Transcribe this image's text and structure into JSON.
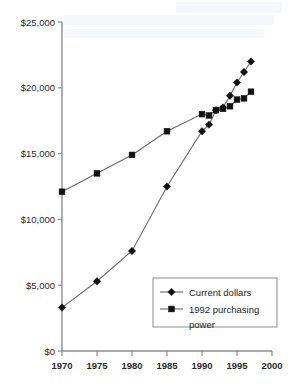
{
  "chart_data": {
    "type": "line",
    "title": "",
    "subtitle": "",
    "xlabel": "",
    "ylabel": "",
    "x": [
      1970,
      1975,
      1980,
      1985,
      1990,
      1991,
      1992,
      1993,
      1994,
      1995,
      1996,
      1997
    ],
    "xlim": [
      1970,
      2000
    ],
    "ylim": [
      0,
      25000
    ],
    "grid": false,
    "legend_position": "bottom-right",
    "xticks": [
      1970,
      1975,
      1980,
      1985,
      1990,
      1995,
      2000
    ],
    "xtick_labels": [
      "1970",
      "1975",
      "1980",
      "1985",
      "1990",
      "1995",
      "2000"
    ],
    "yticks": [
      0,
      5000,
      10000,
      15000,
      20000,
      25000
    ],
    "ytick_labels": [
      "$0",
      "$5,000",
      "$10,000",
      "$15,000",
      "$20,000",
      "$25,000"
    ],
    "series": [
      {
        "name": "Current dollars",
        "marker": "diamond",
        "color": "#111111",
        "values": [
          3300,
          5300,
          7600,
          12500,
          16700,
          17200,
          18300,
          18500,
          19400,
          20400,
          21200,
          22000
        ]
      },
      {
        "name": "1992 purchasing power",
        "marker": "square",
        "color": "#111111",
        "values": [
          12100,
          13500,
          14900,
          16700,
          18000,
          17900,
          18300,
          18400,
          18600,
          19100,
          19200,
          19700
        ]
      }
    ]
  },
  "legend": {
    "entries": [
      {
        "label": "Current dollars",
        "marker": "diamond"
      },
      {
        "label": "1992 purchasing",
        "label2": "power",
        "marker": "square"
      }
    ]
  },
  "colors": {
    "axis": "#8d8d8d",
    "line": "#6b6b6b",
    "marker": "#111111",
    "text": "#2b2b2b",
    "background": "#ffffff"
  }
}
